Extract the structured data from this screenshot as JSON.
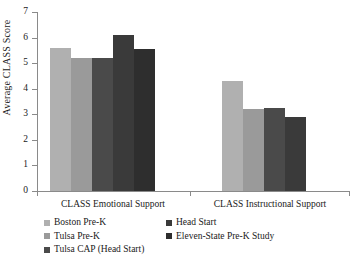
{
  "chart_data": {
    "type": "bar",
    "title": "",
    "xlabel": "",
    "ylabel": "Average CLASS Score",
    "ylim": [
      0,
      7
    ],
    "ytick_values": [
      0,
      1,
      2,
      3,
      4,
      5,
      6,
      7
    ],
    "ytick_labels": [
      "0",
      "1",
      "2",
      "3",
      "4",
      "5",
      "6",
      "7"
    ],
    "grid": false,
    "legend_position": "below-axis",
    "categories": [
      "CLASS Emotional Support",
      "CLASS Instructional Support"
    ],
    "series": [
      {
        "name": "Boston Pre-K",
        "color": "#b0b0b0",
        "values": [
          5.6,
          4.3
        ]
      },
      {
        "name": "Tulsa Pre-K",
        "color": "#9a9a9a",
        "values": [
          5.2,
          3.2
        ]
      },
      {
        "name": "Tulsa CAP (Head Start)",
        "color": "#4a4a4a",
        "values": [
          5.2,
          3.25
        ]
      },
      {
        "name": "Head Start",
        "color": "#3a3a3a",
        "values": [
          6.1,
          2.9
        ]
      },
      {
        "name": "Eleven-State Pre-K Study",
        "color": "#2e2e2e",
        "values": [
          5.55,
          2.1
        ]
      }
    ]
  },
  "legend": {
    "left_column": [
      {
        "label": "Boston Pre-K",
        "color": "#b0b0b0"
      },
      {
        "label": "Tulsa Pre-K",
        "color": "#9a9a9a"
      },
      {
        "label": "Tulsa CAP (Head Start)",
        "color": "#4a4a4a"
      }
    ],
    "right_column": [
      {
        "label": "Head Start",
        "color": "#3a3a3a"
      },
      {
        "label": "Eleven-State Pre-K Study",
        "color": "#2e2e2e"
      }
    ]
  },
  "axis": {
    "y_title": "Average CLASS Score"
  }
}
